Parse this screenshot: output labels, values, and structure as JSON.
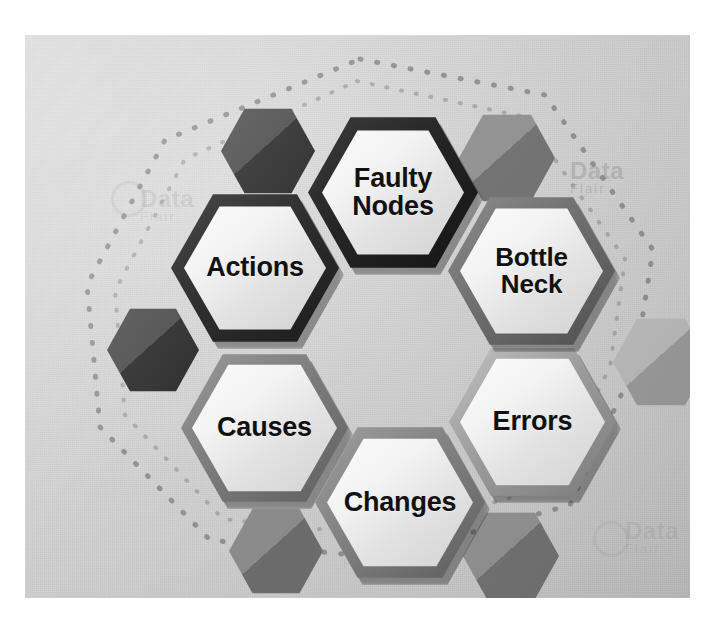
{
  "graphic": {
    "type": "hexagon-cluster-diagram",
    "title": "",
    "canvas_color": "#d4d4d4",
    "page_color": "#ffffff",
    "dotted_outline": {
      "visible": true,
      "color": "#8a8a8a",
      "style": "dotted",
      "shape": "rounded-polygon"
    },
    "nodes": [
      {
        "id": "actions",
        "label": "Actions",
        "lines": [
          "Actions"
        ],
        "border_color": "#2e2e2e",
        "fill_color": "#f1f1f1",
        "text_color": "#111111",
        "position": "upper-left",
        "x": 146,
        "y": 157,
        "w": 168,
        "h": 152,
        "font_size": 27
      },
      {
        "id": "faulty-nodes",
        "label": "Faulty Nodes",
        "lines": [
          "Faulty",
          "Nodes"
        ],
        "border_color": "#242424",
        "fill_color": "#f2f2f2",
        "text_color": "#111111",
        "position": "top-center",
        "x": 283,
        "y": 80,
        "w": 170,
        "h": 155,
        "font_size": 27
      },
      {
        "id": "bottle-neck",
        "label": "Bottle Neck",
        "lines": [
          "Bottle",
          "Neck"
        ],
        "border_color": "#6d6d6d",
        "fill_color": "#f0f0f0",
        "text_color": "#111111",
        "position": "upper-right",
        "x": 423,
        "y": 160,
        "w": 167,
        "h": 152,
        "font_size": 26
      },
      {
        "id": "causes",
        "label": "Causes",
        "lines": [
          "Causes"
        ],
        "border_color": "#7b7b7b",
        "fill_color": "#efefef",
        "text_color": "#111111",
        "position": "lower-left",
        "x": 156,
        "y": 317,
        "w": 167,
        "h": 152,
        "font_size": 27
      },
      {
        "id": "errors",
        "label": "Errors",
        "lines": [
          "Errors"
        ],
        "border_color": "#9a9a9a",
        "fill_color": "#f0f0f0",
        "text_color": "#111111",
        "position": "lower-right",
        "x": 424,
        "y": 311,
        "w": 167,
        "h": 152,
        "font_size": 27
      },
      {
        "id": "changes",
        "label": "Changes",
        "lines": [
          "Changes"
        ],
        "border_color": "#7f7f7f",
        "fill_color": "#f1f1f1",
        "text_color": "#111111",
        "position": "bottom-center",
        "x": 290,
        "y": 390,
        "w": 170,
        "h": 155,
        "font_size": 27
      }
    ],
    "decorations": [
      {
        "id": "deco-top-left",
        "color": "#3c3c3c",
        "x": 196,
        "y": 72,
        "w": 94,
        "h": 88
      },
      {
        "id": "deco-top-right",
        "color": "#868686",
        "x": 434,
        "y": 78,
        "w": 96,
        "h": 90
      },
      {
        "id": "deco-mid-left",
        "color": "#3a3a3a",
        "x": 82,
        "y": 272,
        "w": 92,
        "h": 86
      },
      {
        "id": "deco-right-edge",
        "color": "#b4b4b4",
        "x": 588,
        "y": 282,
        "w": 96,
        "h": 90
      },
      {
        "id": "deco-bottom-left",
        "color": "#7d7d7d",
        "x": 204,
        "y": 472,
        "w": 94,
        "h": 88
      },
      {
        "id": "deco-bottom-right",
        "color": "#858585",
        "x": 438,
        "y": 476,
        "w": 96,
        "h": 90
      }
    ],
    "watermarks": [
      {
        "id": "wm-top-right",
        "text": "Data",
        "sub": "Flair",
        "x": 545,
        "y": 122,
        "size": 24
      },
      {
        "id": "wm-left",
        "text": "Data",
        "sub": "Flair",
        "x": 115,
        "y": 150,
        "size": 24
      },
      {
        "id": "wm-bottom-right",
        "text": "Data",
        "sub": "Flair",
        "x": 600,
        "y": 482,
        "size": 24
      },
      {
        "id": "wm-bottom-left",
        "text": "Data",
        "sub": "Flair",
        "x": 318,
        "y": 500,
        "size": 22
      }
    ]
  }
}
